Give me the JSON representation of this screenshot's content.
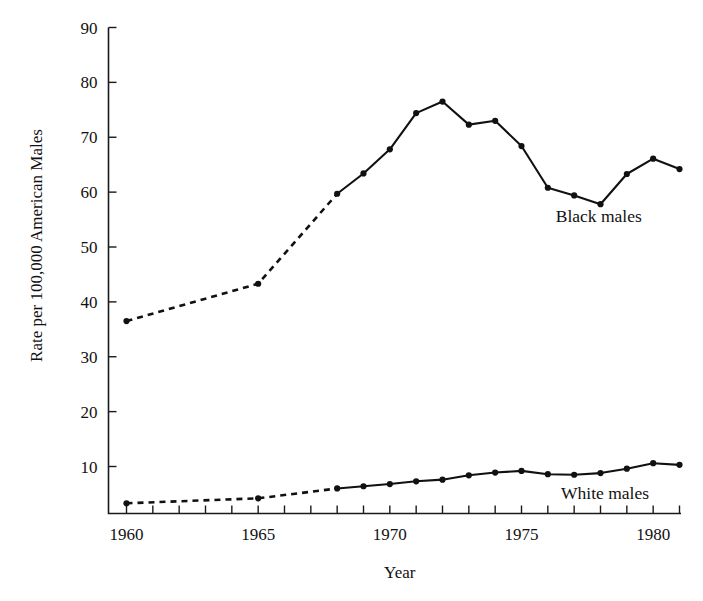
{
  "chart_data": {
    "type": "line",
    "title": "",
    "xlabel": "Year",
    "ylabel": "Rate per 100,000 American Males",
    "xlim": [
      1960,
      1981
    ],
    "ylim": [
      0,
      90
    ],
    "grid": false,
    "legend_position": "inline-right",
    "y_ticks": [
      10,
      20,
      30,
      40,
      50,
      60,
      70,
      80,
      90
    ],
    "x_ticks": [
      1960,
      1961,
      1962,
      1963,
      1964,
      1965,
      1966,
      1967,
      1968,
      1969,
      1970,
      1971,
      1972,
      1973,
      1974,
      1975,
      1976,
      1977,
      1978,
      1979,
      1980,
      1981
    ],
    "x_tick_labels": [
      "1960",
      "",
      "",
      "",
      "",
      "1965",
      "",
      "",
      "",
      "",
      "1970",
      "",
      "",
      "",
      "",
      "1975",
      "",
      "",
      "",
      "",
      "1980",
      ""
    ],
    "series": [
      {
        "name": "Black males",
        "label": "Black males",
        "label_x": 1976.3,
        "label_y": 54.5,
        "style": "mixed",
        "dashed_through": 1968,
        "x": [
          1960,
          1965,
          1968,
          1969,
          1970,
          1971,
          1972,
          1973,
          1974,
          1975,
          1976,
          1977,
          1978,
          1979,
          1980,
          1981
        ],
        "values": [
          36.5,
          43.3,
          59.7,
          63.4,
          67.8,
          74.4,
          76.5,
          72.3,
          73.0,
          68.4,
          60.8,
          59.4,
          57.8,
          63.3,
          66.1,
          64.2
        ]
      },
      {
        "name": "White males",
        "label": "White males",
        "label_x": 1976.5,
        "label_y": 4.0,
        "style": "mixed",
        "dashed_through": 1968,
        "x": [
          1960,
          1965,
          1968,
          1969,
          1970,
          1971,
          1972,
          1973,
          1974,
          1975,
          1976,
          1977,
          1978,
          1979,
          1980,
          1981
        ],
        "values": [
          3.3,
          4.2,
          6.0,
          6.4,
          6.8,
          7.3,
          7.6,
          8.4,
          8.9,
          9.2,
          8.6,
          8.5,
          8.8,
          9.6,
          10.6,
          10.3
        ]
      }
    ]
  },
  "labels": {
    "y_axis_title": "Rate per 100,000 American Males",
    "x_axis_title": "Year",
    "series_black": "Black males",
    "series_white": "White males",
    "y_10": "10",
    "y_20": "20",
    "y_30": "30",
    "y_40": "40",
    "y_50": "50",
    "y_60": "60",
    "y_70": "70",
    "y_80": "80",
    "y_90": "90",
    "x_1960": "1960",
    "x_1965": "1965",
    "x_1970": "1970",
    "x_1975": "1975",
    "x_1980": "1980"
  }
}
